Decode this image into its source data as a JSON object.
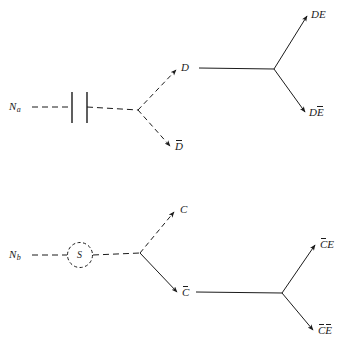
{
  "figure": {
    "type": "particle-decay-diagram",
    "background_color": "#ffffff",
    "stroke_color": "#1b1b1b",
    "diagrams": [
      {
        "id": "diagram-a",
        "source_label": "N",
        "source_subscript": "a",
        "gate_symbol": "capacitor-bars",
        "primary_products": [
          "D",
          "D̅"
        ],
        "secondary_products": [
          "DE",
          "DE̅"
        ],
        "labels": {
          "source": "N",
          "source_sub": "a",
          "branch_up": "D",
          "branch_down": "D",
          "out_up": "DE",
          "out_down_first": "D",
          "out_down_second": "E"
        }
      },
      {
        "id": "diagram-b",
        "source_label": "N",
        "source_subscript": "b",
        "gate_symbol": "circled-S",
        "gate_text": "S",
        "primary_products": [
          "C",
          "C̅"
        ],
        "secondary_products": [
          "C̅E",
          "C̅E̅"
        ],
        "labels": {
          "source": "N",
          "source_sub": "b",
          "branch_up": "C",
          "branch_down": "C",
          "out_up_first": "C",
          "out_up_second": "E",
          "out_down_first": "C",
          "out_down_second": "E"
        }
      }
    ]
  }
}
